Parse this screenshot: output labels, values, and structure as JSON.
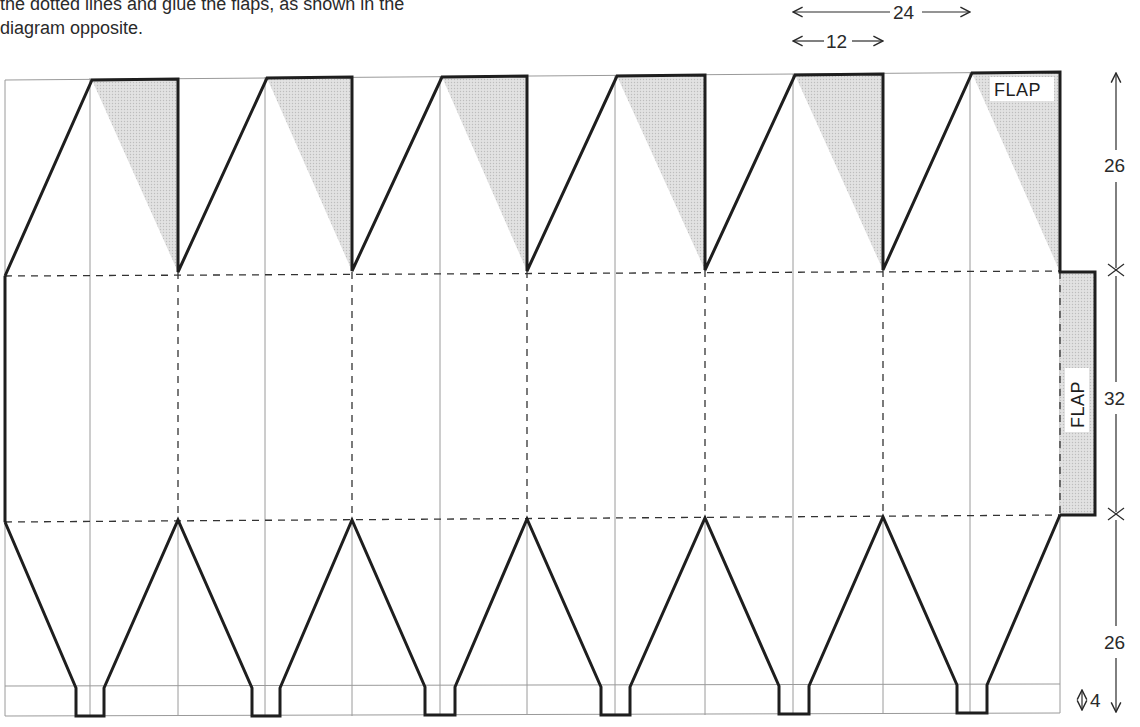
{
  "instructions": {
    "line1": "the dotted lines and glue the flaps, as shown in the",
    "line2": "diagram opposite."
  },
  "dimensions": {
    "top_width_long": "24",
    "top_width_short": "12",
    "upper_height": "26",
    "middle_height": "32",
    "lower_height": "26",
    "base_height": "4"
  },
  "labels": {
    "top_flap": "FLAP",
    "side_flap": "FLAP"
  },
  "colors": {
    "line": "#222222",
    "grid": "#8a8a8a",
    "shade": "#d9d9d9",
    "text": "#2a2a2a"
  },
  "net": {
    "segments": 6,
    "unit_label_spacing": "12"
  }
}
